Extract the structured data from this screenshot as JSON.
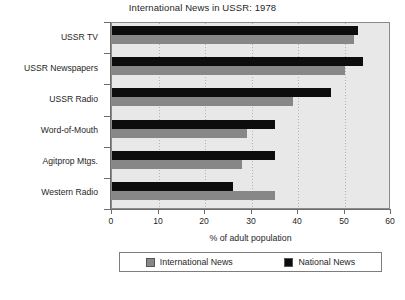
{
  "chart_data": {
    "type": "bar",
    "orientation": "horizontal",
    "title": "International News in USSR: 1978",
    "xlabel": "% of adult population",
    "ylabel": "",
    "categories": [
      "USSR TV",
      "USSR Newspapers",
      "USSR Radio",
      "Word-of-Mouth",
      "Agitprop Mtgs.",
      "Western Radio"
    ],
    "series": [
      {
        "name": "International News",
        "color": "#878787",
        "values": [
          52,
          50,
          39,
          29,
          28,
          35
        ]
      },
      {
        "name": "National News",
        "color": "#0d0d0d",
        "values": [
          53,
          54,
          47,
          35,
          35,
          26
        ]
      }
    ],
    "xlim": [
      0,
      60
    ],
    "xticks": [
      0,
      10,
      20,
      30,
      40,
      50,
      60
    ],
    "xtick_labels": [
      "0",
      "10",
      "20",
      "30",
      "40",
      "50",
      "60"
    ],
    "grid": true,
    "grid_axis": "x",
    "legend_position": "bottom",
    "plot_background": "#e8e8e8"
  },
  "legend": {
    "entries": [
      {
        "label": "International News",
        "color": "#878787"
      },
      {
        "label": "National News",
        "color": "#0d0d0d"
      }
    ]
  }
}
